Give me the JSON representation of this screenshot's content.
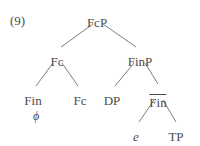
{
  "figure": {
    "example_number": "(9)",
    "background_color": "#ffffff",
    "text_color": "#4b4b4b",
    "line_color": "#6e6e6e"
  },
  "tree": {
    "nodes": [
      {
        "id": "root",
        "label": "FcP",
        "x": 97,
        "y": 16,
        "overline": false,
        "italic": false
      },
      {
        "id": "fc1",
        "label": "Fc",
        "x": 57,
        "y": 55,
        "overline": false,
        "italic": false
      },
      {
        "id": "finp",
        "label": "FinP",
        "x": 140,
        "y": 55,
        "overline": false,
        "italic": false
      },
      {
        "id": "fin1",
        "label": "Fin",
        "x": 33,
        "y": 94,
        "overline": false,
        "italic": false
      },
      {
        "id": "fc2",
        "label": "Fc",
        "x": 80,
        "y": 94,
        "overline": false,
        "italic": false
      },
      {
        "id": "dp",
        "label": "DP",
        "x": 112,
        "y": 94,
        "overline": false,
        "italic": false
      },
      {
        "id": "finbar",
        "label": "Fin",
        "x": 158,
        "y": 94,
        "overline": true,
        "italic": false
      },
      {
        "id": "e",
        "label": "e",
        "x": 136,
        "y": 130,
        "overline": false,
        "italic": true
      },
      {
        "id": "tp",
        "label": "TP",
        "x": 176,
        "y": 130,
        "overline": false,
        "italic": false
      }
    ],
    "edges": [
      {
        "from": "root",
        "to": "fc1",
        "x1": 93,
        "y1": 24,
        "x2": 61,
        "y2": 47
      },
      {
        "from": "root",
        "to": "finp",
        "x1": 103,
        "y1": 24,
        "x2": 136,
        "y2": 47
      },
      {
        "from": "fc1",
        "to": "fin1",
        "x1": 53,
        "y1": 63,
        "x2": 36,
        "y2": 86
      },
      {
        "from": "fc1",
        "to": "fc2",
        "x1": 62,
        "y1": 63,
        "x2": 78,
        "y2": 86
      },
      {
        "from": "finp",
        "to": "dp",
        "x1": 134,
        "y1": 63,
        "x2": 115,
        "y2": 86
      },
      {
        "from": "finp",
        "to": "finbar",
        "x1": 145,
        "y1": 63,
        "x2": 158,
        "y2": 84
      },
      {
        "from": "finbar",
        "to": "e",
        "x1": 154,
        "y1": 100,
        "x2": 139,
        "y2": 122
      },
      {
        "from": "finbar",
        "to": "tp",
        "x1": 163,
        "y1": 100,
        "x2": 176,
        "y2": 122
      }
    ],
    "annotations": [
      {
        "id": "phi-under-fin",
        "label": "ϕ",
        "x": 36,
        "y": 110
      }
    ]
  }
}
